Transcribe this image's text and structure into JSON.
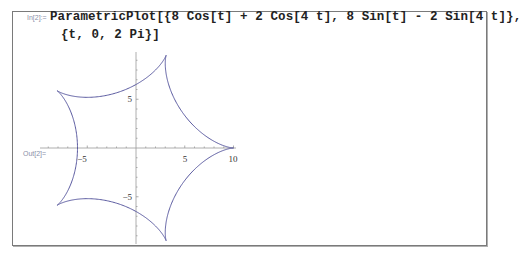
{
  "cell": {
    "input_label": "In[2]:=",
    "input_line1": "ParametricPlot[{8 Cos[t] + 2 Cos[4 t], 8 Sin[t] - 2 Sin[4 t]},",
    "input_line2": "{t, 0, 2 Pi}]",
    "output_label": "Out[2]="
  },
  "chart_data": {
    "type": "line",
    "title": "",
    "function": "x = 8 Cos[t] + 2 Cos[4 t], y = 8 Sin[t] - 2 Sin[4 t], t in [0, 2 Pi]",
    "xlabel": "",
    "ylabel": "",
    "x_ticks": [
      -5,
      5,
      10
    ],
    "y_ticks": [
      5,
      -5
    ],
    "xlim": [
      -10,
      10
    ],
    "ylim": [
      -10,
      10
    ],
    "grid": false,
    "line_color": "#5a5aa0",
    "cusps": [
      [
        10,
        0
      ],
      [
        3.09,
        9.51
      ],
      [
        -8.09,
        5.88
      ],
      [
        -8.09,
        -5.88
      ],
      [
        3.09,
        -9.51
      ]
    ]
  },
  "axes": {
    "x_tick_labels": [
      "−5",
      "5",
      "10"
    ],
    "y_tick_labels": [
      "5",
      "−5"
    ]
  }
}
